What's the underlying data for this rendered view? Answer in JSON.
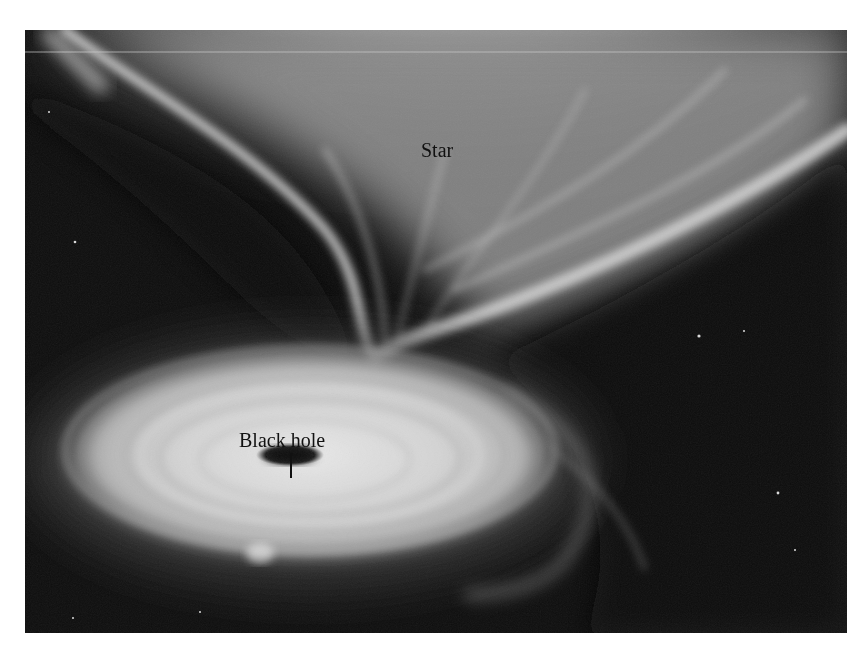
{
  "figure": {
    "labels": {
      "star": "Star",
      "black_hole": "Black hole"
    },
    "colors": {
      "space": "#0d0d0d",
      "gas_light": "#e6e6e6",
      "gas_mid": "#a0a0a0",
      "black_hole": "#101010",
      "label_text": "#111111"
    }
  }
}
